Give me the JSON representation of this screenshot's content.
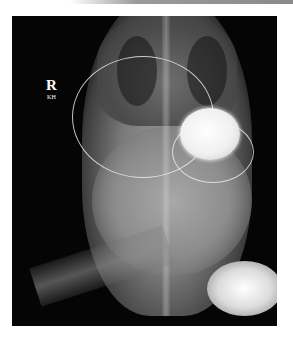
{
  "image": {
    "type": "radiograph",
    "description": "Infant chest and abdomen X-ray with an implanted device and leads",
    "orientation_marker": "R",
    "marker_initials": "KH"
  }
}
